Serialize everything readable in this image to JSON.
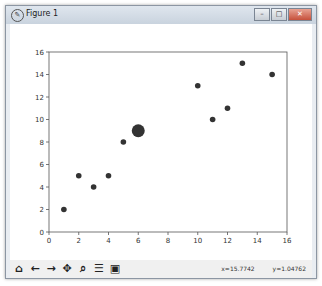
{
  "window": {
    "title": "Figure 1",
    "controls": [
      "minimize",
      "maximize",
      "close"
    ]
  },
  "toolbar": {
    "buttons": [
      "home",
      "back",
      "forward",
      "pan",
      "zoom",
      "configure-subplots",
      "save"
    ],
    "coords_x": "x=15.7742",
    "coords_y": "y=1.04762"
  },
  "chart_data": {
    "type": "scatter",
    "title": "",
    "xlabel": "",
    "ylabel": "",
    "xlim": [
      0,
      16
    ],
    "ylim": [
      0,
      16
    ],
    "xticks": [
      0,
      2,
      4,
      6,
      8,
      10,
      12,
      14,
      16
    ],
    "yticks": [
      0,
      2,
      4,
      6,
      8,
      10,
      12,
      14,
      16
    ],
    "grid": false,
    "points": [
      {
        "x": 1,
        "y": 2,
        "size": "small"
      },
      {
        "x": 2,
        "y": 5,
        "size": "small"
      },
      {
        "x": 3,
        "y": 4,
        "size": "small"
      },
      {
        "x": 4,
        "y": 5,
        "size": "small"
      },
      {
        "x": 5,
        "y": 8,
        "size": "small"
      },
      {
        "x": 6,
        "y": 9,
        "size": "large"
      },
      {
        "x": 10,
        "y": 13,
        "size": "small"
      },
      {
        "x": 11,
        "y": 10,
        "size": "small"
      },
      {
        "x": 12,
        "y": 11,
        "size": "small"
      },
      {
        "x": 13,
        "y": 15,
        "size": "small"
      },
      {
        "x": 15,
        "y": 14,
        "size": "small"
      }
    ],
    "color": "#333333"
  }
}
